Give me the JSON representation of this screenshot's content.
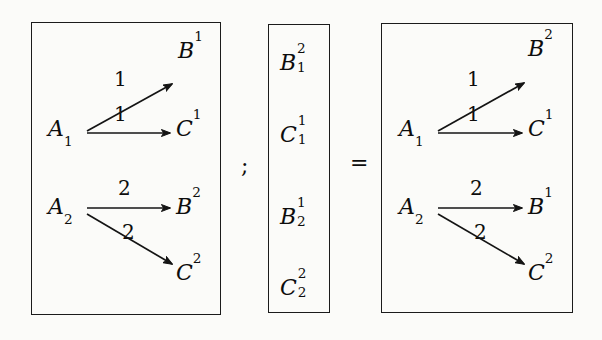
{
  "figure": {
    "type": "commutative-diagram-equation",
    "separators": {
      "semicolon": ";",
      "equals": "="
    },
    "boxes": [
      {
        "id": "left-matrix",
        "name": "left-bracket-matrix",
        "groups": [
          {
            "source": "A",
            "source_sub": "1",
            "edges": [
              {
                "label": "1",
                "target": "B",
                "target_sup": "1",
                "direction": "up-right"
              },
              {
                "label": "1",
                "target": "C",
                "target_sup": "1",
                "direction": "right"
              }
            ]
          },
          {
            "source": "A",
            "source_sub": "2",
            "edges": [
              {
                "label": "2",
                "target": "B",
                "target_sup": "2",
                "direction": "right"
              },
              {
                "label": "2",
                "target": "C",
                "target_sup": "2",
                "direction": "down-right"
              }
            ]
          }
        ]
      },
      {
        "id": "column-vector",
        "name": "column-vector",
        "entries": [
          {
            "base": "B",
            "sup": "2",
            "sub": "1"
          },
          {
            "base": "C",
            "sup": "1",
            "sub": "1"
          },
          {
            "base": "B",
            "sup": "1",
            "sub": "2"
          },
          {
            "base": "C",
            "sup": "2",
            "sub": "2"
          }
        ]
      },
      {
        "id": "right-matrix",
        "name": "right-bracket-matrix",
        "groups": [
          {
            "source": "A",
            "source_sub": "1",
            "edges": [
              {
                "label": "1",
                "target": "B",
                "target_sup": "2",
                "direction": "up-right"
              },
              {
                "label": "1",
                "target": "C",
                "target_sup": "1",
                "direction": "right"
              }
            ]
          },
          {
            "source": "A",
            "source_sub": "2",
            "edges": [
              {
                "label": "2",
                "target": "B",
                "target_sup": "1",
                "direction": "right"
              },
              {
                "label": "2",
                "target": "C",
                "target_sup": "2",
                "direction": "down-right"
              }
            ]
          }
        ]
      }
    ],
    "colors": {
      "ink": "#0d0d0d",
      "rule": "#1b1b1b",
      "paper": "#fbfbf9"
    }
  }
}
